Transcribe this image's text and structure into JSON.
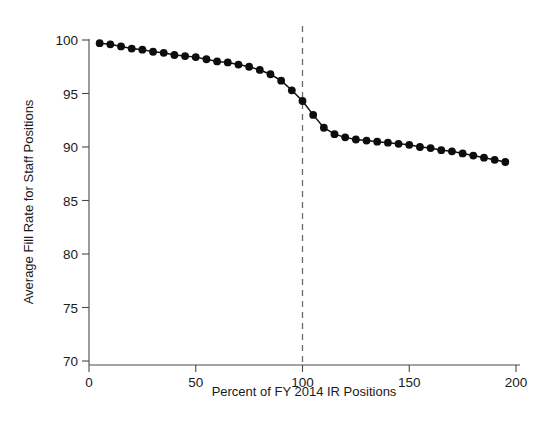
{
  "chart_data": {
    "type": "scatter",
    "title": "",
    "subtitle": "",
    "xlabel": "Percent of FY 2014 IR Positions",
    "ylabel": "Average Fill Rate for Staff Positions",
    "xlim": [
      0,
      200
    ],
    "ylim": [
      70,
      100
    ],
    "xticks": [
      0,
      50,
      100,
      150,
      200
    ],
    "xtick_labels": [
      "0",
      "50",
      "100",
      "150",
      "200"
    ],
    "yticks": [
      70,
      75,
      80,
      85,
      90,
      95,
      100
    ],
    "ytick_labels": [
      "70",
      "75",
      "80",
      "85",
      "90",
      "95",
      "100"
    ],
    "grid": false,
    "legend": null,
    "marker_style": "filled-circle",
    "line_style": "solid",
    "series_color": "#0d0d0d",
    "annotations": [
      {
        "name": "reference-line-100-percent",
        "type": "vertical-dashed-line",
        "x": 100,
        "color": "#6a6a6a",
        "label": ""
      }
    ],
    "x": [
      5,
      10,
      15,
      20,
      25,
      30,
      35,
      40,
      45,
      50,
      55,
      60,
      65,
      70,
      75,
      80,
      85,
      90,
      95,
      100,
      105,
      110,
      115,
      120,
      125,
      130,
      135,
      140,
      145,
      150,
      155,
      160,
      165,
      170,
      175,
      180,
      185,
      190,
      195
    ],
    "values": [
      99.7,
      99.6,
      99.4,
      99.2,
      99.1,
      98.9,
      98.8,
      98.6,
      98.5,
      98.4,
      98.2,
      98.0,
      97.9,
      97.7,
      97.5,
      97.2,
      96.8,
      96.2,
      95.3,
      94.3,
      93.0,
      91.8,
      91.2,
      90.9,
      90.7,
      90.6,
      90.5,
      90.4,
      90.3,
      90.2,
      90.0,
      89.9,
      89.7,
      89.6,
      89.4,
      89.2,
      89.0,
      88.8,
      88.6
    ]
  },
  "axes": {
    "x_axis_name": "x-axis",
    "y_axis_name": "y-axis"
  }
}
